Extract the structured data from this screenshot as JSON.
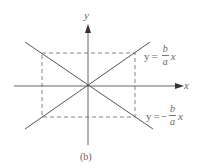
{
  "figure": {
    "caption": "(b)",
    "axes": {
      "x_label": "x",
      "y_label": "y",
      "origin": [
        88,
        86
      ],
      "x_axis": {
        "from": [
          14,
          86
        ],
        "to": [
          182,
          86
        ]
      },
      "y_axis": {
        "from": [
          88,
          145
        ],
        "to": [
          88,
          24
        ]
      }
    },
    "rectangle": {
      "left": 42,
      "right": 135,
      "top": 53,
      "bottom": 117,
      "style": "dashed"
    },
    "lines": [
      {
        "name": "positive-asymptote",
        "from": [
          25,
          129
        ],
        "to": [
          150,
          42
        ],
        "label": {
          "lhs": "y",
          "op": "=",
          "sign": "",
          "num": "b",
          "den": "a",
          "var": "x"
        }
      },
      {
        "name": "negative-asymptote",
        "from": [
          25,
          42
        ],
        "to": [
          153,
          129
        ],
        "label": {
          "lhs": "y",
          "op": "=",
          "sign": "−",
          "num": "b",
          "den": "a",
          "var": "x"
        }
      }
    ],
    "colors": {
      "line": "#555555",
      "dashed": "#777777",
      "text": "#666666"
    }
  }
}
